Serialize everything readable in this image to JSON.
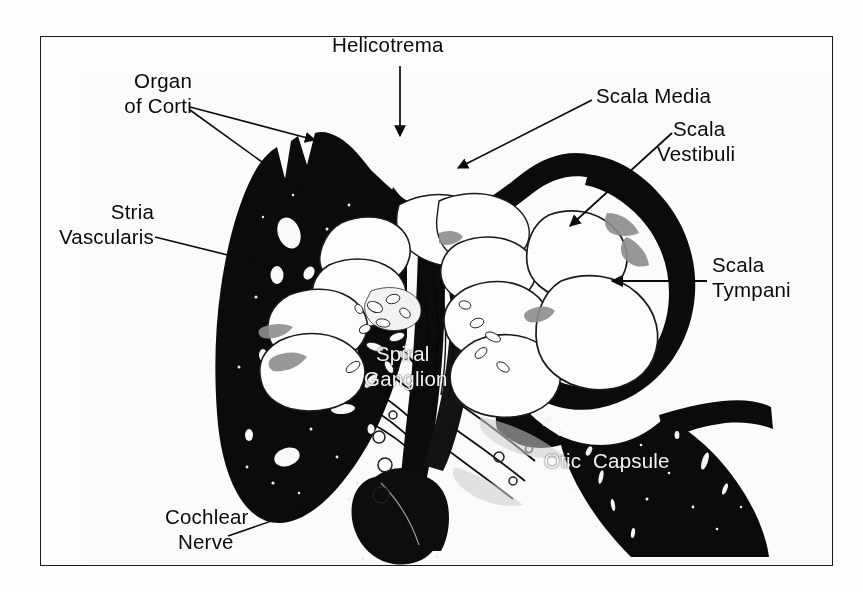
{
  "figure": {
    "kind": "histological-cross-section",
    "subject": "cochlea",
    "frame_color": "#1b1b1b",
    "background_color": "#ffffff",
    "tissue_color": "#0b0b0b",
    "lumen_color": "#ffffff"
  },
  "labels": {
    "helicotrema": "Helicotrema",
    "organ_of_corti_line1": "Organ",
    "organ_of_corti_line2": "of Corti",
    "stria_line1": "Stria",
    "stria_line2": "Vascularis",
    "scala_media": "Scala Media",
    "scala_vestibuli_line1": "Scala",
    "scala_vestibuli_line2": "Vestibuli",
    "scala_tympani_line1": "Scala",
    "scala_tympani_line2": "Tympani",
    "spiral_ganglion_line1": "Spiral",
    "spiral_ganglion_line2": "Ganglion",
    "otic_capsule": "Otic  Capsule",
    "cochlear_nerve_line1": "Cochlear",
    "cochlear_nerve_line2": "Nerve"
  },
  "leaders": {
    "helicotrema": "arrow-down",
    "organ_of_corti": "two-leader-lines",
    "stria_vascularis": "leader-line",
    "scala_media": "leader-line",
    "scala_vestibuli": "arrow-down-left",
    "scala_tympani": "arrow-left",
    "cochlear_nerve": "arrow-up-right"
  }
}
